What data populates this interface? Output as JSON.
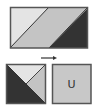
{
  "diagram": {
    "top_rectangle": {
      "bands": [
        "light",
        "medium",
        "dark"
      ],
      "colors": {
        "light": "#e4e4e4",
        "medium": "#c4c4c4",
        "dark": "#333333",
        "border": "#555555"
      }
    },
    "arrow": {
      "direction": "right",
      "color": "#333333"
    },
    "bottom_left_square": {
      "pieces": [
        "light-top",
        "medium-right",
        "dark-lower-left"
      ],
      "colors": {
        "light": "#e4e4e4",
        "medium": "#c4c4c4",
        "dark": "#333333",
        "border": "#555555"
      }
    },
    "bottom_right_square": {
      "label": "U",
      "colors": {
        "fill": "#c8c8c8",
        "border": "#555555"
      }
    }
  }
}
